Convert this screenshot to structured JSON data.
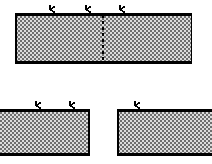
{
  "figure": {
    "title": "Hatched block diagram with downward load arrows",
    "type": "engineering-schematic",
    "canvas": {
      "width": 212,
      "height": 164,
      "background": "#ffffff"
    },
    "style": {
      "fill_pattern": "stipple-checker",
      "fill_color": "#d9d9d9",
      "pattern_dot_color": "#5a5a5a",
      "border_color": "#000000",
      "border_width": 2.2,
      "arrow_color": "#000000",
      "dashed_line_color": "#000000"
    },
    "blocks": [
      {
        "name": "top-block",
        "label": "Upper continuous block",
        "x": 15,
        "y": 14,
        "width": 177,
        "height": 49,
        "clipped_left": false,
        "clipped_right": false
      },
      {
        "name": "bottom-left-block",
        "label": "Lower left block",
        "x": -6,
        "y": 110,
        "width": 96,
        "height": 45,
        "clipped_left": true,
        "clipped_right": false
      },
      {
        "name": "bottom-right-block",
        "label": "Lower right block",
        "x": 117,
        "y": 110,
        "width": 95,
        "height": 45,
        "clipped_left": false,
        "clipped_right": true
      }
    ],
    "arrows": [
      {
        "name": "load-arrow-top-1",
        "block": "top-block",
        "x": 50,
        "tip_y": 14,
        "length": 9
      },
      {
        "name": "load-arrow-top-2",
        "block": "top-block",
        "x": 86,
        "tip_y": 14,
        "length": 9
      },
      {
        "name": "load-arrow-top-3",
        "block": "top-block",
        "x": 120,
        "tip_y": 14,
        "length": 9
      },
      {
        "name": "load-arrow-bottom-left-1",
        "block": "bottom-left-block",
        "x": 36,
        "tip_y": 110,
        "length": 9
      },
      {
        "name": "load-arrow-bottom-left-2",
        "block": "bottom-left-block",
        "x": 70,
        "tip_y": 110,
        "length": 9
      },
      {
        "name": "load-arrow-bottom-right-1",
        "block": "bottom-right-block",
        "x": 135,
        "tip_y": 110,
        "length": 9
      }
    ],
    "dashed_lines": [
      {
        "name": "separation-dashed-line",
        "label": "Vertical dashed separation line in upper block",
        "x": 103,
        "y1": 14,
        "y2": 63,
        "dash": "3 3"
      }
    ]
  }
}
